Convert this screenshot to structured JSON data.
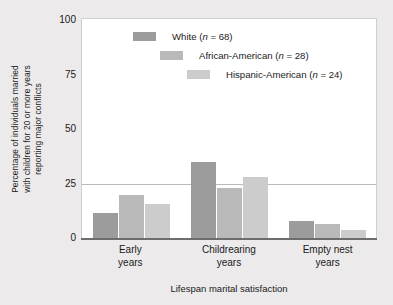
{
  "chart_data": {
    "type": "bar",
    "title": "",
    "xlabel": "Lifespan marital satisfaction",
    "ylabel": "Percentage of individuals married with children for 20 or more years reporting major conflicts",
    "ylabel_lines": [
      "Percentage of individuals married",
      "with children for 20 or more years",
      "reporting major conflicts"
    ],
    "categories": [
      "Early years",
      "Childrearing years",
      "Empty nest years"
    ],
    "category_lines": [
      [
        "Early",
        "years"
      ],
      [
        "Childrearing",
        "years"
      ],
      [
        "Empty nest",
        "years"
      ]
    ],
    "series": [
      {
        "name": "White",
        "n": 68,
        "legend": "White (n = 68)",
        "color": "#9c9c9c",
        "values": [
          12,
          35,
          8
        ]
      },
      {
        "name": "African-American",
        "n": 28,
        "legend": "African-American (n = 28)",
        "color": "#b9b9b9",
        "values": [
          20,
          23,
          7
        ]
      },
      {
        "name": "Hispanic-American",
        "n": 24,
        "legend": "Hispanic-American (n = 24)",
        "color": "#cccccc",
        "values": [
          16,
          28,
          4
        ]
      }
    ],
    "ylim": [
      0,
      100
    ],
    "yticks": [
      0,
      25,
      50,
      75,
      100
    ],
    "ytick_labels": [
      "0",
      "25",
      "50",
      "75",
      "100"
    ],
    "gridlines": [
      25
    ],
    "grid": true,
    "legend_position": "inside-top-center"
  },
  "legend": {
    "entries": [
      {
        "label_prefix": "White (",
        "italic": "n",
        "label_suffix": " = 68)"
      },
      {
        "label_prefix": "African-American (",
        "italic": "n",
        "label_suffix": " = 28)"
      },
      {
        "label_prefix": "Hispanic-American (",
        "italic": "n",
        "label_suffix": " = 24)"
      }
    ]
  }
}
